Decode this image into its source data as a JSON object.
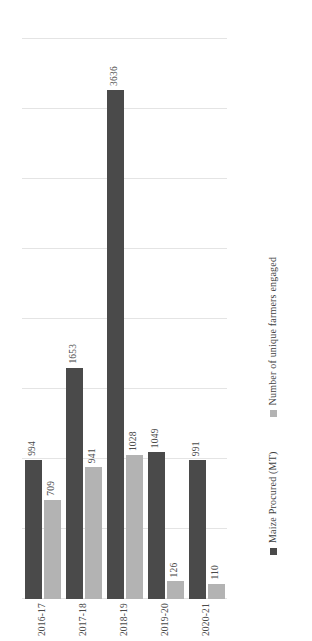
{
  "chart_data": {
    "type": "bar",
    "orientation": "horizontal",
    "title": "",
    "subtitle": "",
    "xlabel": "",
    "ylabel": "",
    "categories": [
      "2016-17",
      "2017-18",
      "2018-19",
      "2019-20",
      "2020-21"
    ],
    "series": [
      {
        "name": "Maize Procured (MT)",
        "color": "#4a4a4a",
        "values": [
          994,
          1653,
          3636,
          1049,
          991
        ],
        "labels": [
          "994",
          "1653",
          "3636",
          "1049",
          "991"
        ]
      },
      {
        "name": "Number of unique farmers engaged",
        "color": "#b3b3b3",
        "values": [
          709,
          941,
          1028,
          126,
          110
        ],
        "labels": [
          "709",
          "941",
          "1028",
          "126",
          "110"
        ]
      }
    ],
    "xlim": [
      0,
      4000
    ],
    "gridline_values": [
      0,
      500,
      1000,
      1500,
      2000,
      2500,
      3000,
      3500,
      4000
    ],
    "grid": true,
    "legend_position": "bottom",
    "data_labels": true
  },
  "legend": {
    "items": [
      {
        "label": "Maize Procured (MT)",
        "color": "#4a4a4a"
      },
      {
        "label": "Number of unique farmers engaged",
        "color": "#b3b3b3"
      }
    ]
  }
}
